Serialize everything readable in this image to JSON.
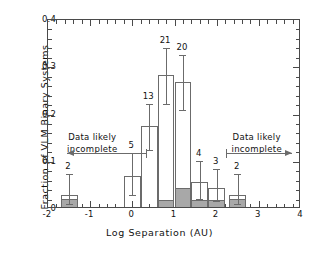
{
  "chart_data": {
    "type": "bar",
    "title": "",
    "xlabel": "Log Separation (AU)",
    "ylabel": "Fraction of VLM Binary Systems",
    "xlim": [
      -2,
      4
    ],
    "ylim": [
      0,
      0.4
    ],
    "grid": false,
    "legend": "none",
    "bin_width": 0.4,
    "xticks": [
      "-2",
      "-1",
      "0",
      "1",
      "2",
      "3",
      "4"
    ],
    "xtick_values": [
      -2,
      -1,
      0,
      1,
      2,
      3,
      4
    ],
    "yticks": [
      "0",
      "0.1",
      "0.2",
      "0.3",
      "0.4"
    ],
    "ytick_values": [
      0,
      0.1,
      0.2,
      0.3,
      0.4
    ],
    "bars": [
      {
        "x0": -1.7,
        "x1": -1.3,
        "value": 0.026,
        "filled_value": 0.016,
        "count": "2",
        "err_low": 0.01,
        "err_high": 0.075
      },
      {
        "x0": -0.2,
        "x1": 0.2,
        "value": 0.066,
        "filled_value": 0.0,
        "count": "5",
        "err_low": 0.03,
        "err_high": 0.118
      },
      {
        "x0": 0.2,
        "x1": 0.6,
        "value": 0.171,
        "filled_value": 0.0,
        "count": "13",
        "err_low": 0.125,
        "err_high": 0.222
      },
      {
        "x0": 0.6,
        "x1": 1.0,
        "value": 0.28,
        "filled_value": 0.014,
        "count": "21",
        "err_low": 0.222,
        "err_high": 0.341
      },
      {
        "x0": 1.0,
        "x1": 1.4,
        "value": 0.265,
        "filled_value": 0.04,
        "count": "20",
        "err_low": 0.21,
        "err_high": 0.325
      },
      {
        "x0": 1.4,
        "x1": 1.8,
        "value": 0.052,
        "filled_value": 0.014,
        "count": "4",
        "err_low": 0.022,
        "err_high": 0.102
      },
      {
        "x0": 1.8,
        "x1": 2.2,
        "value": 0.04,
        "filled_value": 0.014,
        "count": "3",
        "err_low": 0.016,
        "err_high": 0.085
      },
      {
        "x0": 2.3,
        "x1": 2.7,
        "value": 0.026,
        "filled_value": 0.016,
        "count": "2",
        "err_low": 0.01,
        "err_high": 0.075
      }
    ],
    "annotations": [
      {
        "id": "left-incomplete",
        "text_line1": "Data likely",
        "text_line2": "incomplete",
        "text_x": -0.95,
        "text_y": 0.165,
        "arrow_from_x": 0.33,
        "arrow_to_x": -1.55,
        "arrow_y": 0.118,
        "direction": "left"
      },
      {
        "id": "right-incomplete",
        "text_line1": "Data likely",
        "text_likely": "",
        "text_line2": "incomplete",
        "text_x": 2.95,
        "text_y": 0.165,
        "arrow_from_x": 2.22,
        "arrow_to_x": 3.78,
        "arrow_y": 0.118,
        "direction": "right"
      }
    ],
    "colors": {
      "bar_outline": "#6b6b6b",
      "bar_fill_shaded": "#a8a8a8",
      "bar_fill_open": "#ffffff",
      "axis": "#4a4a4a",
      "text": "#111111",
      "background": "#ffffff"
    }
  }
}
